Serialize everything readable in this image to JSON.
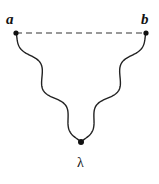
{
  "diagram": {
    "vertices": [
      {
        "id": "a",
        "label": "a"
      },
      {
        "id": "b",
        "label": "b"
      },
      {
        "id": "lambda",
        "label": "λ"
      }
    ],
    "edges": [
      {
        "from": "a",
        "to": "b",
        "style": "dashed"
      },
      {
        "from": "a",
        "to": "lambda",
        "style": "wavy"
      },
      {
        "from": "b",
        "to": "lambda",
        "style": "wavy"
      }
    ]
  }
}
